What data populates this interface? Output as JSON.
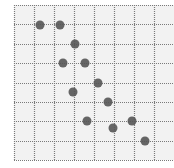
{
  "chart_data": {
    "type": "scatter",
    "title": "",
    "xlabel": "",
    "ylabel": "",
    "grid": true,
    "legend": null,
    "plot_area_px": {
      "left": 14,
      "top": 5,
      "right": 174,
      "bottom": 160
    },
    "grid_px": {
      "vertical_lines_x": [
        14,
        34,
        54,
        74,
        94,
        114,
        134,
        154
      ],
      "horizontal_lines_y": [
        5,
        24,
        44,
        63,
        83,
        102,
        121,
        141,
        160
      ]
    },
    "colors": {
      "background": "#f2f2f2",
      "grid": "#7a7a7a",
      "point": "#555555"
    },
    "point_radius_px": 4.5,
    "points_px": [
      {
        "x": 40,
        "y": 25
      },
      {
        "x": 60,
        "y": 25
      },
      {
        "x": 75,
        "y": 44
      },
      {
        "x": 63,
        "y": 63
      },
      {
        "x": 85,
        "y": 63
      },
      {
        "x": 98,
        "y": 83
      },
      {
        "x": 73,
        "y": 92
      },
      {
        "x": 108,
        "y": 102
      },
      {
        "x": 87,
        "y": 121
      },
      {
        "x": 132,
        "y": 121
      },
      {
        "x": 113,
        "y": 128
      },
      {
        "x": 145,
        "y": 141
      }
    ]
  }
}
